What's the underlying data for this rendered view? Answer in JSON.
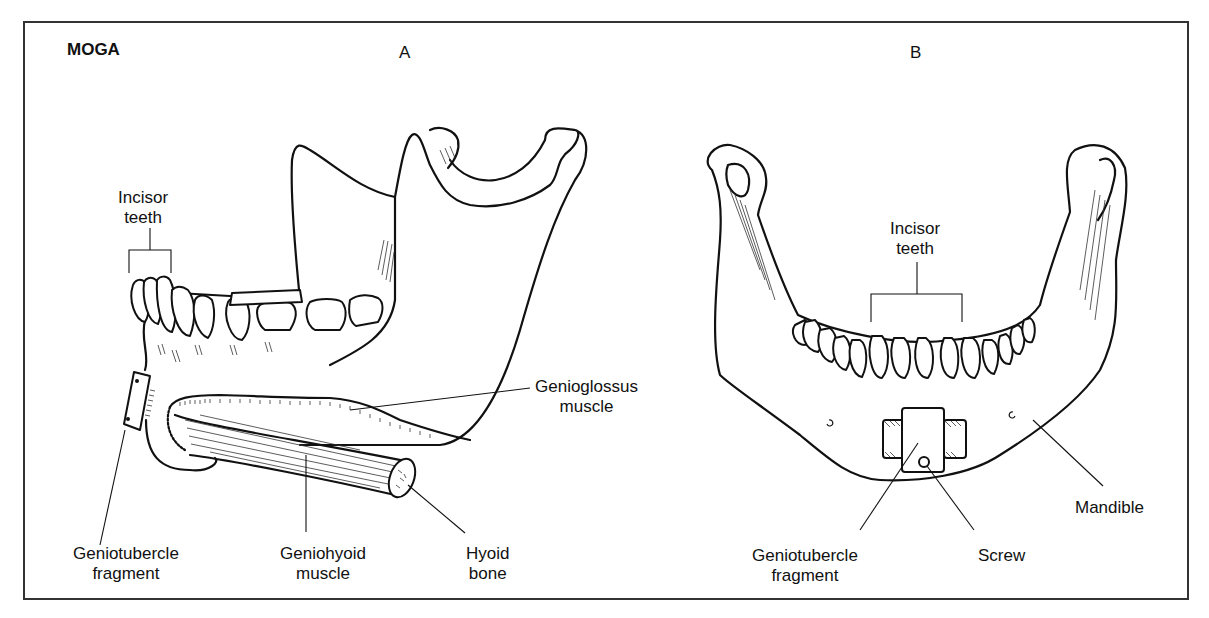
{
  "figure": {
    "title": "MOGA",
    "panels": [
      {
        "id": "A",
        "letter": "A",
        "view": "lateral view of mandible",
        "labels": {
          "incisor_teeth": [
            "Incisor",
            "teeth"
          ],
          "genioglossus_muscle": [
            "Genioglossus",
            "muscle"
          ],
          "geniotubercle_fragment": [
            "Geniotubercle",
            "fragment"
          ],
          "geniohyoid_muscle": [
            "Geniohyoid",
            "muscle"
          ],
          "hyoid_bone": [
            "Hyoid",
            "bone"
          ]
        }
      },
      {
        "id": "B",
        "letter": "B",
        "view": "frontal view of mandible",
        "labels": {
          "incisor_teeth": [
            "Incisor",
            "teeth"
          ],
          "geniotubercle_fragment": [
            "Geniotubercle",
            "fragment"
          ],
          "screw": [
            "Screw"
          ],
          "mandible": [
            "Mandible"
          ]
        }
      }
    ]
  }
}
